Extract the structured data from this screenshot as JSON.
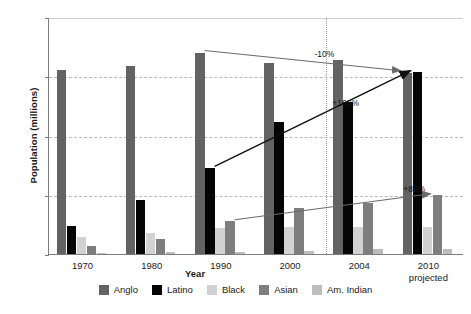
{
  "chart_data": {
    "type": "bar",
    "title": "",
    "xlabel": "Year",
    "ylabel": "Population (millions)",
    "categories": [
      "1970",
      "1980",
      "1990",
      "2000",
      "2004",
      "2010"
    ],
    "category_sublabels": [
      "",
      "",
      "",
      "",
      "",
      "projected"
    ],
    "ylim": [
      0,
      20
    ],
    "yticks": [
      0,
      5,
      10,
      15,
      20
    ],
    "ytick_labels": [
      "0",
      "5",
      "10",
      "15",
      "20"
    ],
    "grid": true,
    "legend_position": "bottom",
    "series": [
      {
        "name": "Anglo",
        "color": "#636363",
        "values": [
          15.5,
          15.9,
          17.0,
          16.1,
          16.4,
          15.3
        ]
      },
      {
        "name": "Latino",
        "color": "#050505",
        "values": [
          2.4,
          4.6,
          7.3,
          11.1,
          12.8,
          15.4
        ]
      },
      {
        "name": "Black",
        "color": "#d2d2d2",
        "values": [
          1.4,
          1.8,
          2.2,
          2.3,
          2.3,
          2.3
        ]
      },
      {
        "name": "Asian",
        "color": "#7e7e7e",
        "values": [
          0.7,
          1.3,
          2.8,
          3.9,
          4.3,
          5.0
        ]
      },
      {
        "name": "Am. Indian",
        "color": "#bdbdbd",
        "values": [
          0.1,
          0.2,
          0.2,
          0.25,
          0.4,
          0.4
        ]
      }
    ],
    "annotations": [
      {
        "id": "anglo-change",
        "text": "-10%",
        "series": "Anglo",
        "from_category": "1990",
        "to_category": "2010"
      },
      {
        "id": "latino-change",
        "text": "+106%",
        "series": "Latino",
        "from_category": "1990",
        "to_category": "2010"
      },
      {
        "id": "asian-change",
        "text": "+85%",
        "series": "Asian",
        "from_category": "1990",
        "to_category": "2010"
      }
    ],
    "divider_after_category": "2000"
  },
  "legend": {
    "items": [
      {
        "label": "Anglo"
      },
      {
        "label": "Latino"
      },
      {
        "label": "Black"
      },
      {
        "label": "Asian"
      },
      {
        "label": "Am. Indian"
      }
    ]
  }
}
